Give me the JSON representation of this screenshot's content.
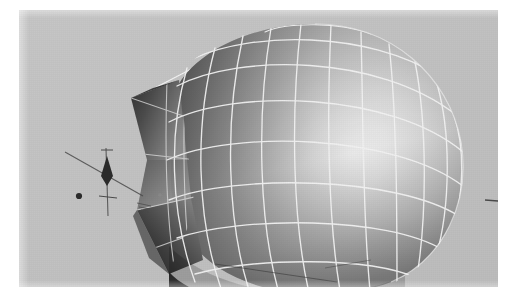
{
  "app": {
    "title": "3D Modeling Viewport",
    "kind": "wireframe-shaded-viewport-screenshot"
  },
  "viewport": {
    "label": "perspective-viewport",
    "background_color": "#c2c2c2",
    "bounds": {
      "left": 19,
      "top": 10,
      "width": 479,
      "height": 277
    },
    "render_mode": "smooth-shaded-with-wireframe",
    "wireframe_color": "#f2f2f2",
    "page_background_color": "#ffffff"
  },
  "model": {
    "name": "teardrop-sphere-mesh",
    "description": "Smooth shaded spheroid with a sharp conical spike protruding to the left",
    "surface_light_color": "#fbfbfb",
    "surface_mid_color": "#b4b4b4",
    "surface_dark_color": "#3a3a3a",
    "specular_highlight": {
      "cx": 322,
      "cy": 150,
      "rx": 120,
      "ry": 96
    },
    "wireframe_meridians": 14,
    "wireframe_parallels": 9,
    "spike_tip": {
      "x": 118,
      "y": 200
    }
  },
  "gizmo": {
    "name": "transform-manipulator",
    "axis_color": "#4a4a4a",
    "handle_color": "#2b2b2b",
    "vertical_axis_label": "y-axis-handle",
    "diagonal_axis_label": "z-axis-handle",
    "cone_label": "axis-cone-arrow",
    "dot_label": "pivot-point-handle"
  },
  "overlays": {
    "guide_line_label": "construction-guide-line",
    "edge_tick_label": "axis-edge-tick"
  }
}
